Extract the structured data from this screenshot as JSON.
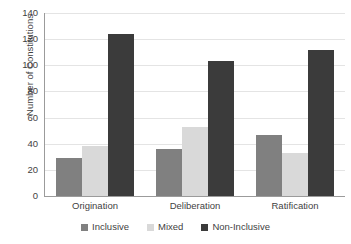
{
  "chart_data": {
    "type": "bar",
    "title": "",
    "subtitle": "",
    "xlabel": "",
    "ylabel": "Number of Constitutions",
    "categories": [
      "Origination",
      "Deliberation",
      "Ratification"
    ],
    "series": [
      {
        "name": "Inclusive",
        "color": "#808080",
        "values": [
          29,
          36,
          47
        ]
      },
      {
        "name": "Mixed",
        "color": "#d9d9d9",
        "values": [
          38,
          53,
          33
        ]
      },
      {
        "name": "Non-Inclusive",
        "color": "#3b3b3b",
        "values": [
          124,
          103,
          112
        ]
      }
    ],
    "ylim": [
      0,
      140
    ],
    "ytick_labels": [
      "0",
      "20",
      "40",
      "60",
      "80",
      "100",
      "120",
      "140"
    ],
    "ytick_values": [
      0,
      20,
      40,
      60,
      80,
      100,
      120,
      140
    ],
    "grid": true,
    "grid_axis": "y",
    "legend_position": "bottom",
    "annotations": []
  }
}
